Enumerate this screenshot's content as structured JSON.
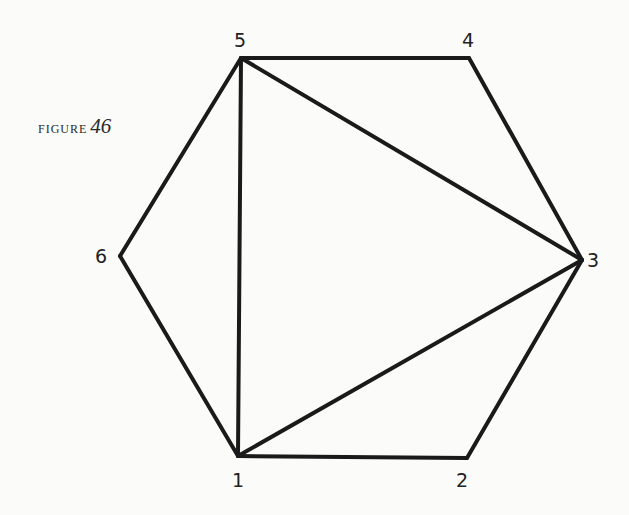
{
  "caption": {
    "word": "figure",
    "number": "46"
  },
  "diagram": {
    "type": "hexagon-triangulation",
    "stroke_color": "#1a1a1a",
    "vertices": [
      {
        "id": "1",
        "label": "1",
        "x": 238,
        "y": 456,
        "lx": 232,
        "ly": 487
      },
      {
        "id": "2",
        "label": "2",
        "x": 467,
        "y": 458,
        "lx": 456,
        "ly": 487
      },
      {
        "id": "3",
        "label": "3",
        "x": 582,
        "y": 260,
        "lx": 587,
        "ly": 267
      },
      {
        "id": "4",
        "label": "4",
        "x": 469,
        "y": 58,
        "lx": 462,
        "ly": 47
      },
      {
        "id": "5",
        "label": "5",
        "x": 241,
        "y": 58,
        "lx": 234,
        "ly": 47
      },
      {
        "id": "6",
        "label": "6",
        "x": 120,
        "y": 256,
        "lx": 95,
        "ly": 263
      }
    ],
    "edges": [
      [
        "1",
        "2"
      ],
      [
        "2",
        "3"
      ],
      [
        "3",
        "4"
      ],
      [
        "4",
        "5"
      ],
      [
        "5",
        "6"
      ],
      [
        "6",
        "1"
      ],
      [
        "1",
        "5"
      ],
      [
        "1",
        "3"
      ],
      [
        "3",
        "5"
      ]
    ]
  }
}
